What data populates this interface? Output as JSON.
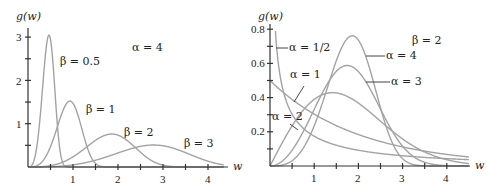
{
  "chart_data": [
    {
      "type": "line",
      "title": "Weibull densities, alpha = 4",
      "ylabel": "g(w)",
      "xlabel": "w",
      "annotation": "α = 4",
      "xlim": [
        0,
        4.4
      ],
      "ylim": [
        0,
        3.2
      ],
      "xticks": [
        1,
        2,
        3,
        4
      ],
      "xminor": [
        0.5,
        1.5,
        2.5,
        3.5
      ],
      "yticks": [
        1,
        2,
        3
      ],
      "yminor": [
        0.5,
        1.5,
        2.5
      ],
      "grid": false,
      "alpha": 4,
      "series": [
        {
          "name": "β = 0.5",
          "beta": 0.5,
          "peak": [
            0.47,
            3.05
          ]
        },
        {
          "name": "β = 1",
          "beta": 1,
          "peak": [
            0.93,
            1.52
          ]
        },
        {
          "name": "β = 2",
          "beta": 2,
          "peak": [
            1.86,
            0.76
          ]
        },
        {
          "name": "β = 3",
          "beta": 3,
          "peak": [
            2.79,
            0.51
          ]
        }
      ]
    },
    {
      "type": "line",
      "title": "Weibull densities, beta = 2",
      "ylabel": "g(w)",
      "xlabel": "w",
      "annotation": "β = 2",
      "xlim": [
        0,
        4.5
      ],
      "ylim": [
        0,
        0.85
      ],
      "xticks": [
        1,
        2,
        3,
        4
      ],
      "xminor": [
        0.5,
        1.5,
        2.5,
        3.5
      ],
      "yticks": [
        0.2,
        0.4,
        0.6,
        0.8
      ],
      "yminor": [
        0.1,
        0.3,
        0.5,
        0.7
      ],
      "grid": false,
      "beta": 2,
      "series": [
        {
          "name": "α = 1/2",
          "alpha": 0.5
        },
        {
          "name": "α = 1",
          "alpha": 1,
          "value_at_0": 0.5
        },
        {
          "name": "α = 2",
          "alpha": 2,
          "peak": [
            1.41,
            0.43
          ]
        },
        {
          "name": "α = 3",
          "alpha": 3,
          "peak": [
            1.75,
            0.59
          ]
        },
        {
          "name": "α = 4",
          "alpha": 4,
          "peak": [
            1.86,
            0.76
          ]
        }
      ]
    }
  ],
  "labels": {
    "left": {
      "ylabel": "g(w)",
      "xlabel": "w",
      "annotation": "α = 4",
      "yticks": [
        "1",
        "2",
        "3"
      ],
      "xticks": [
        "1",
        "2",
        "3",
        "4"
      ],
      "curves": [
        "β = 0.5",
        "β = 1",
        "β = 2",
        "β = 3"
      ]
    },
    "right": {
      "ylabel": "g(w)",
      "xlabel": "w",
      "annotation": "β = 2",
      "yticks": [
        "0.2",
        "0.4",
        "0.6",
        "0.8"
      ],
      "xticks": [
        "1",
        "2",
        "3",
        "4"
      ],
      "curves": [
        "α = 1/2",
        "α = 1",
        "α = 2",
        "α = 4",
        "α = 3"
      ]
    }
  },
  "colors": {
    "curve": "#a3a3a3",
    "axis": "#333333",
    "text": "#222222"
  }
}
